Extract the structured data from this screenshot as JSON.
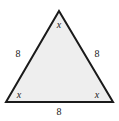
{
  "figure": {
    "type": "equilateral-triangle-diagram",
    "background_color": "#ffffff",
    "fill_color": "#eeeeee",
    "stroke_color": "#1a1a1a",
    "stroke_width": 2,
    "vertices": {
      "apex": {
        "x": 59,
        "y": 11
      },
      "bottom_left": {
        "x": 6,
        "y": 102
      },
      "bottom_right": {
        "x": 113,
        "y": 102
      }
    },
    "angle_labels": {
      "apex": "x",
      "bottom_left": "x",
      "bottom_right": "x"
    },
    "side_labels": {
      "left": "8",
      "right": "8",
      "bottom": "8"
    }
  }
}
